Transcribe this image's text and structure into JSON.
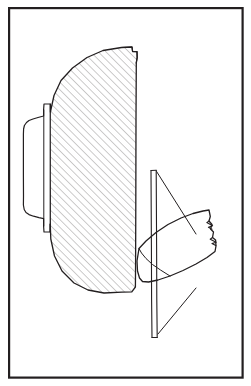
{
  "figure": {
    "kind": "technical-line-drawing",
    "title": "",
    "caption": "",
    "background_color": "#ffffff",
    "ink_color": "#231f20",
    "frame": {
      "name": "drawing-border",
      "x": 8,
      "y": 7,
      "width": 235,
      "height": 371,
      "stroke_width": 2.2,
      "color": "#231f20"
    },
    "hatching": {
      "name": "section-hatch",
      "angle_deg": 45,
      "spacing_px": 5.4,
      "stroke_width": 0.7,
      "color": "#6f6c6b",
      "direction": "lower-left-to-upper-right"
    },
    "line_weights": {
      "outline": 1.3,
      "interior": 1.0,
      "hairline": 0.8
    },
    "parts": [
      {
        "id": "sectioned-dome",
        "label": "sectioned dome body",
        "hatched": true,
        "stroke_width": 1.3
      },
      {
        "id": "stepped-flange",
        "label": "stepped hub flange",
        "hatched": false,
        "stroke_width": 1.2
      },
      {
        "id": "vertical-fin",
        "label": "vertical fin strip",
        "hatched": false,
        "stroke_width": 1.1
      },
      {
        "id": "leaf-blade",
        "label": "leaf shaped blade",
        "hatched": false,
        "stroke_width": 1.3
      },
      {
        "id": "break-symbols",
        "label": "break line symbols",
        "count": 2,
        "hatched": false,
        "stroke_width": 1.1
      }
    ],
    "geometry": {
      "dome_outline": "M 121.5 47.5 L 132.0 47.0 L 132.6 51.5 L 137.0 51.6 L 137.2 57.5 L 136.3 63.0 L 136.0 120.0 L 135.8 205.0 L 135.6 262.0 L 135.4 287.0 L 131.8 291.8 L 122.0 292.2 L 104.0 293.0 L 88.0 290.0 L 74.0 283.0 L 62.0 271.0 L 54.5 256.0 L 50.8 239.0 L 50.0 218.0 L 50.2 196.0 L 50.0 174.0 L 50.2 152.0 L 50.0 130.0 L 50.4 112.0 L 54.0 95.5 L 61.0 80.5 L 72.5 68.0 L 87.0 57.5 L 103.0 50.5 Z",
      "dome_top_notch": "M 121.5 47.5 L 132.0 47.0 L 132.6 51.5 L 137.0 51.6 L 137.2 57.5 L 136.2 63.0",
      "flange_outer": "M 50.4 112.0 L 50.4 104.0 L 44.0 104.0 L 43.6 110.0 L 43.6 116.0 L 38.0 117.5 L 33.0 119.0 L 29.0 120.5 L 26.5 122.5 L 24.4 125.5 L 23.6 129.0 L 23.4 134.0 L 23.4 175.0 L 23.5 196.0 L 23.4 205.0 L 24.2 209.5 L 26.0 212.5 L 29.0 214.6 L 33.5 216.2 L 39.0 217.6 L 43.6 218.6 L 43.6 226.0 L 44.0 232.0 L 50.0 232.0 L 50.0 224.0",
      "flange_inner_line": "M 43.8 110.0 L 43.8 226.0",
      "flange_step_line": "M 50.2 104.0 L 50.2 232.0",
      "fin_left_edge": "M 151.0 170.5 L 151.4 245.0 L 151.6 300.0 L 152.0 337.5",
      "fin_right_edge": "M 156.2 170.3 L 156.6 245.0 L 156.8 300.0 L 157.2 337.5",
      "fin_top_cap": "M 151.0 170.5 L 156.2 170.3",
      "fin_bottom_cap": "M 152.0 337.5 L 157.2 337.5",
      "fin_diagonal_upper": "M 156.6 171.5 L 196.0 234.0",
      "fin_diagonal_lower": "M 196.0 288.0 L 158.0 334.0",
      "blade_outline": "M 139.0 248.5 L 146.0 241.0 L 156.0 232.5 L 168.0 224.5 L 181.0 218.0 L 193.0 213.5 L 203.0 211.0 L 209.0 210.0 L 210.3 216.5 L 209.0 221.0 L 212.0 224.5 L 210.5 229.0 L 213.5 232.0 L 212.5 237.5 L 215.6 240.0 L 216.0 246.0 L 215.0 251.5 L 207.0 257.5 L 196.0 264.0 L 183.0 270.5 L 170.0 276.0 L 158.0 280.0 L 148.5 282.0 L 142.5 281.5 L 139.5 278.0 L 137.5 271.0 L 137.0 261.0 Z",
      "blade_inner_curve": "M 137.2 262.0 L 146.0 274.5 L 158.0 280.0",
      "blade_seam": "M 139.0 248.5 L 141.5 253.0 L 146.0 258.5 L 152.5 264.5 L 160.5 270.0 L 170.0 276.0",
      "break_zigzag_1": "M 209.0 221.0 L 206.8 222.6 L 212.6 225.8 L 208.4 227.2 L 212.0 229.2",
      "break_zigzag_2": "M 212.5 237.5 L 210.2 239.2 L 216.2 242.2 L 212.0 243.6 L 215.8 245.6",
      "baseline_under_blade": "M 121.5 292.0 L 135.5 291.6 L 151.2 292.0 L 157.0 292.0 L 166.0 290.0"
    }
  }
}
